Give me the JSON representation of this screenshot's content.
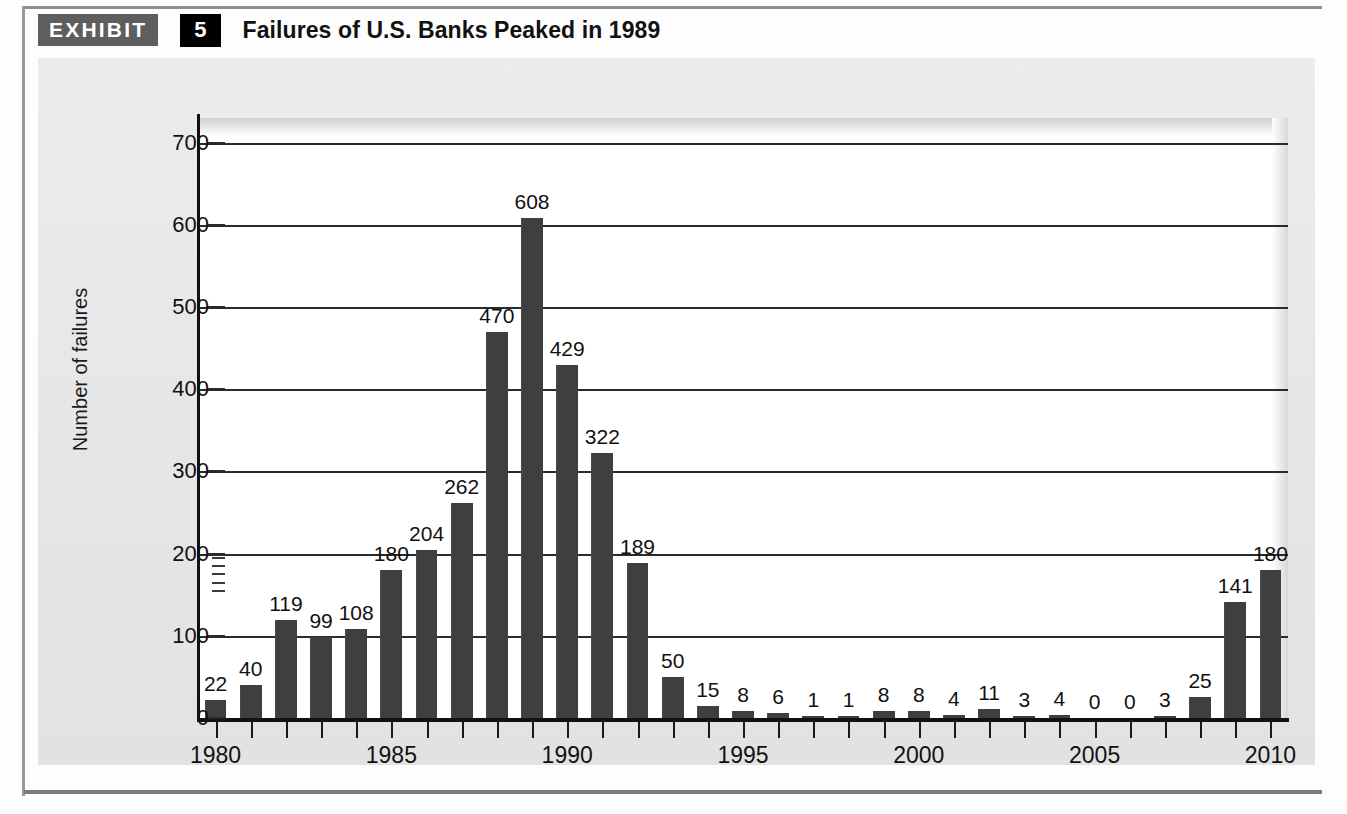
{
  "exhibit": {
    "badge_label": "EXHIBIT",
    "number": "5",
    "title": "Failures of U.S. Banks Peaked in 1989"
  },
  "colors": {
    "bar": "#3f3f3f",
    "panel_background": "#e8e8e8",
    "plot_background": "#ffffff",
    "axis": "#111111",
    "badge_gray": "#5e5e5e",
    "badge_black": "#000000"
  },
  "chart_data": {
    "type": "bar",
    "title": "Failures of U.S. Banks Peaked in 1989",
    "xlabel": "",
    "ylabel": "Number of failures",
    "ylim": [
      0,
      730
    ],
    "yticks": [
      0,
      100,
      200,
      300,
      400,
      500,
      600,
      700
    ],
    "ytick_labels": [
      "0",
      "100",
      "200",
      "300",
      "400",
      "500",
      "600",
      "700"
    ],
    "grid": true,
    "legend": "none",
    "xtick_labels": [
      "1980",
      "1985",
      "1990",
      "1995",
      "2000",
      "2005",
      "2010"
    ],
    "xtick_years": [
      1980,
      1985,
      1990,
      1995,
      2000,
      2005,
      2010
    ],
    "categories": [
      "1980",
      "1981",
      "1982",
      "1983",
      "1984",
      "1985",
      "1986",
      "1987",
      "1988",
      "1989",
      "1990",
      "1991",
      "1992",
      "1993",
      "1994",
      "1995",
      "1996",
      "1997",
      "1998",
      "1999",
      "2000",
      "2001",
      "2002",
      "2003",
      "2004",
      "2005",
      "2006",
      "2007",
      "2008",
      "2009",
      "2010"
    ],
    "values": [
      22,
      40,
      119,
      99,
      108,
      180,
      204,
      262,
      470,
      608,
      429,
      322,
      189,
      50,
      15,
      8,
      6,
      1,
      1,
      8,
      8,
      4,
      11,
      3,
      4,
      0,
      0,
      3,
      25,
      141,
      180
    ],
    "data_labels": [
      "22",
      "40",
      "119",
      "99",
      "108",
      "180",
      "204",
      "262",
      "470",
      "608",
      "429",
      "322",
      "189",
      "50",
      "15",
      "8",
      "6",
      "1",
      "1",
      "8",
      "8",
      "4",
      "11",
      "3",
      "4",
      "0",
      "0",
      "3",
      "25",
      "141",
      "180"
    ]
  }
}
